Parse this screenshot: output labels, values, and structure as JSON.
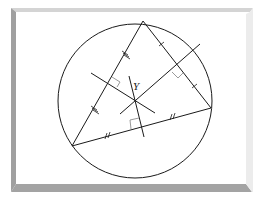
{
  "figure": {
    "center_label": "Y",
    "colors": {
      "background": "#ffffff",
      "stroke": "#1a1a1a",
      "right_angle_mark": "#9a9a9a",
      "frame_dark": "#9c9c9c",
      "frame_light": "#e6e6e6",
      "frame_top": "#d2d2d2"
    },
    "circle": {
      "cx": 135,
      "cy": 101,
      "r": 77
    },
    "triangle": {
      "vertices": [
        {
          "name": "top",
          "x": 143,
          "y": 21
        },
        {
          "name": "right",
          "x": 211,
          "y": 108
        },
        {
          "name": "bottom-left",
          "x": 72,
          "y": 146
        }
      ]
    },
    "circumcenter": {
      "x": 135,
      "y": 100
    },
    "tick_marks": {
      "left_side": "triple",
      "right_side": "single",
      "bottom_side": "double"
    }
  }
}
